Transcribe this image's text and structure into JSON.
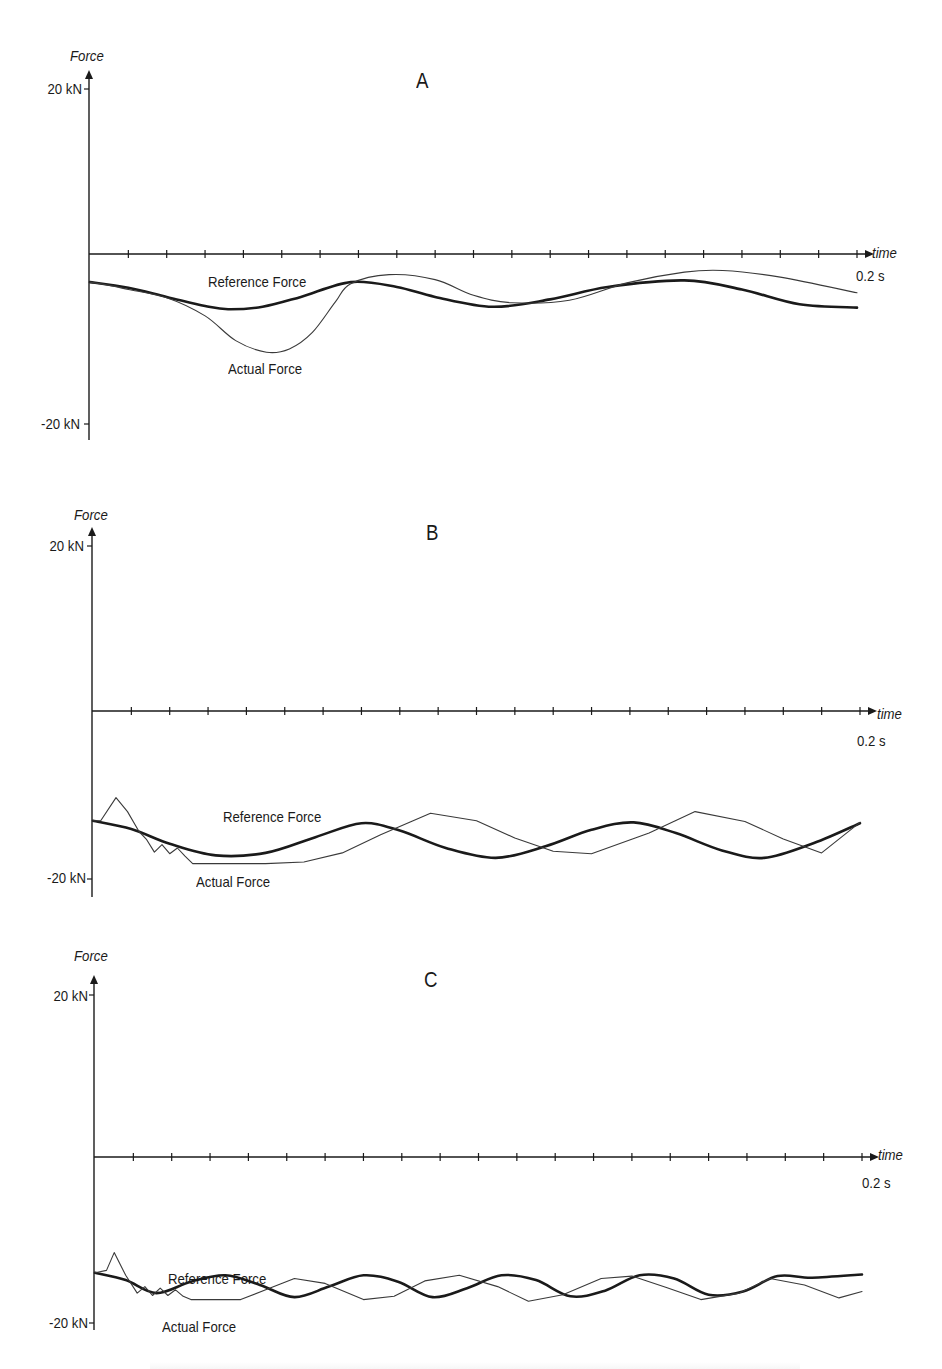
{
  "figure": {
    "panels": [
      {
        "id": "A",
        "title": "A",
        "y_axis_title": "Force",
        "y_tick_top": "20 kN",
        "y_tick_bottom": "-20 kN",
        "x_axis_title": "time",
        "x_end_label": "0.2 s",
        "reference_label": "Reference Force",
        "actual_label": "Actual Force"
      },
      {
        "id": "B",
        "title": "B",
        "y_axis_title": "Force",
        "y_tick_top": "20 kN",
        "y_tick_bottom": "-20 kN",
        "x_axis_title": "time",
        "x_end_label": "0.2 s",
        "reference_label": "Reference Force",
        "actual_label": "Actual Force"
      },
      {
        "id": "C",
        "title": "C",
        "y_axis_title": "Force",
        "y_tick_top": "20 kN",
        "y_tick_bottom": "-20 kN",
        "x_axis_title": "time",
        "x_end_label": "0.2 s",
        "reference_label": "Reference Force",
        "actual_label": "Actual Force"
      }
    ],
    "colors": {
      "line": "#1a1a1a",
      "reference": "#1a1a1a",
      "actual": "#3a3a3a",
      "background": "#ffffff"
    }
  },
  "chart_data": [
    {
      "type": "line",
      "title": "A",
      "xlabel": "time",
      "ylabel": "Force",
      "xlim": [
        0,
        0.2
      ],
      "ylim": [
        -20,
        20
      ],
      "x_unit": "s",
      "y_unit": "kN",
      "x_ticks_count": 20,
      "x_tick_step": 0.01,
      "y_tick_labels": [
        "20 kN",
        "-20 kN"
      ],
      "x_end_label": "0.2 s",
      "grid": false,
      "legend": "inline labels",
      "series": [
        {
          "name": "Reference Force",
          "style": "thick",
          "x": [
            0,
            0.01,
            0.02,
            0.03,
            0.036,
            0.045,
            0.055,
            0.068,
            0.08,
            0.09,
            0.105,
            0.12,
            0.135,
            0.155,
            0.17,
            0.185,
            0.2
          ],
          "y": [
            -3.4,
            -4.1,
            -5.2,
            -6.3,
            -6.7,
            -6.4,
            -5.2,
            -3.4,
            -4.0,
            -5.2,
            -6.4,
            -5.5,
            -4.0,
            -3.2,
            -4.3,
            -6.1,
            -6.5
          ]
        },
        {
          "name": "Actual Force",
          "style": "thin",
          "x": [
            0,
            0.005,
            0.01,
            0.02,
            0.03,
            0.038,
            0.046,
            0.052,
            0.058,
            0.064,
            0.068,
            0.078,
            0.09,
            0.1,
            0.11,
            0.125,
            0.14,
            0.155,
            0.165,
            0.18,
            0.2
          ],
          "y": [
            -3.4,
            -3.8,
            -4.3,
            -5.3,
            -7.5,
            -10.5,
            -11.9,
            -11.5,
            -9.5,
            -5.8,
            -3.6,
            -2.5,
            -3.1,
            -5.0,
            -5.9,
            -5.6,
            -3.5,
            -2.2,
            -2.0,
            -2.8,
            -4.7
          ]
        }
      ]
    },
    {
      "type": "line",
      "title": "B",
      "xlabel": "time",
      "ylabel": "Force",
      "xlim": [
        0,
        0.2
      ],
      "ylim": [
        -20,
        20
      ],
      "x_unit": "s",
      "y_unit": "kN",
      "x_ticks_count": 20,
      "x_tick_step": 0.01,
      "y_tick_labels": [
        "20 kN",
        "-20 kN"
      ],
      "x_end_label": "0.2 s",
      "grid": false,
      "legend": "inline labels",
      "series": [
        {
          "name": "Reference Force",
          "style": "thick",
          "x": [
            0,
            0.01,
            0.02,
            0.032,
            0.045,
            0.058,
            0.07,
            0.08,
            0.092,
            0.105,
            0.118,
            0.13,
            0.141,
            0.152,
            0.164,
            0.175,
            0.188,
            0.2
          ],
          "y": [
            -13.3,
            -14.3,
            -16.1,
            -17.5,
            -17.2,
            -15.3,
            -13.6,
            -14.5,
            -16.6,
            -17.8,
            -16.4,
            -14.4,
            -13.5,
            -14.8,
            -16.9,
            -17.8,
            -16.0,
            -13.6
          ]
        },
        {
          "name": "Actual Force",
          "style": "thin",
          "x": [
            0,
            0.002,
            0.006,
            0.009,
            0.012,
            0.014,
            0.016,
            0.018,
            0.02,
            0.022,
            0.024,
            0.026,
            0.035,
            0.045,
            0.055,
            0.065,
            0.075,
            0.088,
            0.1,
            0.11,
            0.12,
            0.13,
            0.145,
            0.157,
            0.17,
            0.18,
            0.19,
            0.2
          ],
          "y": [
            -13.3,
            -13.3,
            -10.5,
            -12.2,
            -14.6,
            -15.6,
            -17.1,
            -16.2,
            -17.3,
            -16.6,
            -17.6,
            -18.5,
            -18.5,
            -18.5,
            -18.3,
            -17.2,
            -15.0,
            -12.4,
            -13.3,
            -15.4,
            -17.0,
            -17.3,
            -14.8,
            -12.2,
            -13.4,
            -15.5,
            -17.2,
            -13.5
          ]
        }
      ]
    },
    {
      "type": "line",
      "title": "C",
      "xlabel": "time",
      "ylabel": "Force",
      "xlim": [
        0,
        0.2
      ],
      "ylim": [
        -20,
        20
      ],
      "x_unit": "s",
      "y_unit": "kN",
      "x_ticks_count": 20,
      "x_tick_step": 0.01,
      "y_tick_labels": [
        "20 kN",
        "-20 kN"
      ],
      "x_end_label": "0.2 s",
      "grid": false,
      "legend": "inline labels",
      "series": [
        {
          "name": "Reference Force",
          "style": "thick",
          "x": [
            0,
            0.008,
            0.016,
            0.025,
            0.034,
            0.043,
            0.052,
            0.061,
            0.07,
            0.079,
            0.088,
            0.097,
            0.106,
            0.115,
            0.124,
            0.133,
            0.142,
            0.151,
            0.16,
            0.169,
            0.178,
            0.187,
            0.2
          ],
          "y": [
            -14.3,
            -15.2,
            -16.8,
            -15.4,
            -14.6,
            -15.8,
            -17.3,
            -16.0,
            -14.6,
            -15.4,
            -17.3,
            -16.2,
            -14.6,
            -15.2,
            -17.2,
            -16.5,
            -14.6,
            -15.0,
            -17.0,
            -16.6,
            -14.7,
            -14.9,
            -14.5
          ]
        },
        {
          "name": "Actual Force",
          "style": "thin",
          "x": [
            0,
            0.003,
            0.005,
            0.008,
            0.011,
            0.013,
            0.015,
            0.017,
            0.019,
            0.021,
            0.023,
            0.025,
            0.03,
            0.038,
            0.045,
            0.052,
            0.06,
            0.07,
            0.078,
            0.086,
            0.095,
            0.105,
            0.113,
            0.122,
            0.132,
            0.14,
            0.149,
            0.158,
            0.168,
            0.176,
            0.185,
            0.194,
            0.2
          ],
          "y": [
            -14.3,
            -14.0,
            -11.8,
            -14.6,
            -16.8,
            -16.0,
            -17.1,
            -16.2,
            -17.1,
            -16.4,
            -17.2,
            -17.6,
            -17.6,
            -17.6,
            -16.3,
            -15.0,
            -15.6,
            -17.6,
            -17.2,
            -15.3,
            -14.6,
            -16.0,
            -17.8,
            -17.0,
            -15.0,
            -14.7,
            -16.1,
            -17.6,
            -16.8,
            -15.0,
            -15.8,
            -17.4,
            -16.6
          ]
        }
      ]
    }
  ]
}
